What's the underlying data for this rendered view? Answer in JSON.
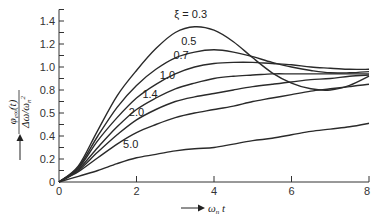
{
  "chart_data": {
    "type": "line",
    "title": "",
    "xlabel": "ω_n t",
    "ylabel": "φ_e∞(t) / (Δω / ω_n²)",
    "xlim": [
      0,
      8
    ],
    "ylim": [
      0,
      1.5
    ],
    "x_ticks": [
      0,
      2,
      4,
      6,
      8
    ],
    "x_tick_labels": [
      "0",
      "2",
      "4",
      "6",
      "8"
    ],
    "y_ticks": [
      0,
      0.2,
      0.4,
      0.6,
      0.8,
      1.0,
      1.2,
      1.4
    ],
    "y_tick_labels": [
      "0",
      "0.2",
      "0.4",
      "0.5",
      "0.8",
      "1.0",
      "1.2",
      "1.4"
    ],
    "grid": false,
    "legend": "inline curve labels",
    "x": [
      0,
      0.5,
      1,
      1.5,
      2,
      2.5,
      3,
      3.5,
      4,
      4.5,
      5,
      5.5,
      6,
      6.5,
      7,
      7.5,
      8
    ],
    "series": [
      {
        "name": "ξ = 0.3",
        "label": "ξ = 0.3",
        "values": [
          0,
          0.14,
          0.45,
          0.75,
          0.97,
          1.16,
          1.3,
          1.35,
          1.32,
          1.22,
          1.08,
          0.95,
          0.86,
          0.81,
          0.8,
          0.84,
          0.92
        ]
      },
      {
        "name": "ξ = 0.5",
        "label": "0.5",
        "values": [
          0,
          0.13,
          0.4,
          0.65,
          0.84,
          0.98,
          1.08,
          1.13,
          1.15,
          1.13,
          1.09,
          1.04,
          1.0,
          0.97,
          0.95,
          0.95,
          0.96
        ]
      },
      {
        "name": "ξ = 0.7",
        "label": "0.7",
        "values": [
          0,
          0.12,
          0.36,
          0.56,
          0.73,
          0.85,
          0.94,
          1.0,
          1.03,
          1.04,
          1.04,
          1.03,
          1.02,
          1.0,
          0.99,
          0.98,
          0.98
        ]
      },
      {
        "name": "ξ = 1.0",
        "label": "1.0",
        "values": [
          0,
          0.11,
          0.3,
          0.48,
          0.63,
          0.73,
          0.81,
          0.86,
          0.9,
          0.92,
          0.93,
          0.94,
          0.94,
          0.94,
          0.94,
          0.94,
          0.94
        ]
      },
      {
        "name": "ξ = 1.4",
        "label": "1.4",
        "values": [
          0,
          0.1,
          0.26,
          0.41,
          0.54,
          0.63,
          0.7,
          0.74,
          0.77,
          0.8,
          0.83,
          0.85,
          0.87,
          0.89,
          0.9,
          0.92,
          0.93
        ]
      },
      {
        "name": "ξ = 2.0",
        "label": "2.0",
        "values": [
          0,
          0.09,
          0.21,
          0.33,
          0.43,
          0.5,
          0.56,
          0.6,
          0.63,
          0.66,
          0.7,
          0.73,
          0.76,
          0.79,
          0.81,
          0.83,
          0.85
        ]
      },
      {
        "name": "ξ = 5.0",
        "label": "5.0",
        "values": [
          0,
          0.05,
          0.1,
          0.16,
          0.21,
          0.24,
          0.27,
          0.29,
          0.3,
          0.33,
          0.36,
          0.38,
          0.41,
          0.44,
          0.46,
          0.48,
          0.51
        ]
      }
    ],
    "label_positions": [
      {
        "series": "ξ = 0.3",
        "x": 3.4,
        "y": 1.43
      },
      {
        "series": "ξ = 0.5",
        "x": 3.35,
        "y": 1.19
      },
      {
        "series": "ξ = 0.7",
        "x": 3.15,
        "y": 1.07
      },
      {
        "series": "ξ = 1.0",
        "x": 2.8,
        "y": 0.9
      },
      {
        "series": "ξ = 1.4",
        "x": 2.35,
        "y": 0.73
      },
      {
        "series": "ξ = 2.0",
        "x": 2.0,
        "y": 0.57
      },
      {
        "series": "ξ = 5.0",
        "x": 1.85,
        "y": 0.3
      }
    ]
  }
}
